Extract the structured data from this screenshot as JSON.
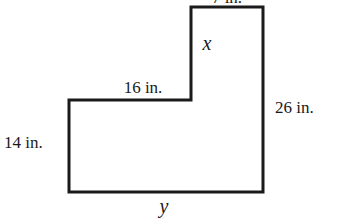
{
  "diagram": {
    "type": "L-shaped polygon with labeled sides",
    "shape_vertices": [
      [
        69,
        100
      ],
      [
        191,
        100
      ],
      [
        191,
        7
      ],
      [
        263,
        7
      ],
      [
        263,
        192
      ],
      [
        69,
        192
      ]
    ],
    "stroke_color": "#1a1a1a",
    "labels": {
      "top": "7 in.",
      "inner_vertical": "x",
      "inner_horizontal": "16 in.",
      "right": "26 in.",
      "left": "14 in.",
      "bottom": "y"
    }
  }
}
